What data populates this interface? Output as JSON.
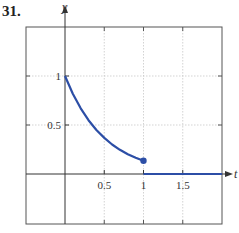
{
  "problem_number": "31.",
  "colors": {
    "curve": "#2c4ea6",
    "axis": "#333333",
    "frame": "#555555",
    "grid": "#c8c8c8"
  },
  "chart_data": {
    "type": "line",
    "title": "",
    "xlabel": "t",
    "ylabel": "y",
    "xlim": [
      -0.5,
      2.0
    ],
    "ylim": [
      -0.5,
      1.5
    ],
    "grid": true,
    "x_ticks": [
      0.5,
      1,
      1.5
    ],
    "x_tick_labels": [
      "0.5",
      "1",
      "1.5"
    ],
    "y_ticks": [
      0.5,
      1
    ],
    "y_tick_labels": [
      "0.5",
      "1"
    ],
    "series": [
      {
        "name": "f(t) = e^(-2t), 0 <= t < 1",
        "x": [
          0,
          0.1,
          0.2,
          0.3,
          0.4,
          0.5,
          0.6,
          0.7,
          0.8,
          0.9,
          1.0
        ],
        "y": [
          1.0,
          0.819,
          0.67,
          0.549,
          0.449,
          0.368,
          0.301,
          0.247,
          0.202,
          0.165,
          0.135
        ],
        "endpoint_marker": {
          "x": 1.0,
          "y": 0.135,
          "filled": true
        }
      },
      {
        "name": "f(t) = 0, t >= 1",
        "x": [
          1.0,
          2.0
        ],
        "y": [
          0,
          0
        ]
      }
    ]
  }
}
